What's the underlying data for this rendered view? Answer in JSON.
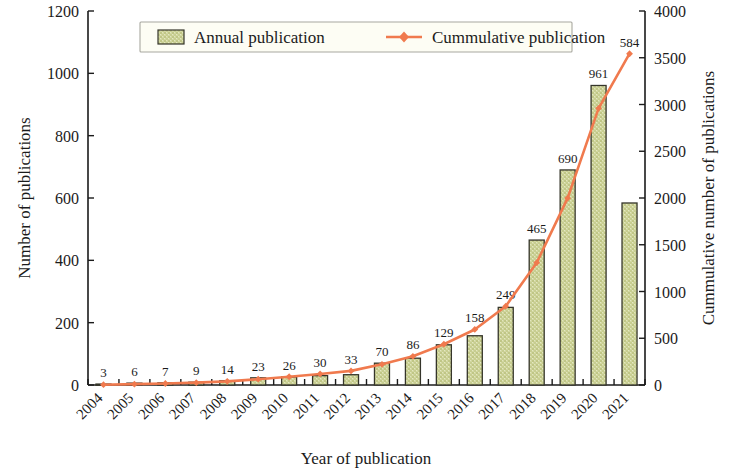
{
  "chart_data": {
    "type": "bar",
    "title": "",
    "subtitle": "",
    "xlabel": "Year of publication",
    "ylabel": "Number of publications",
    "y2label": "Cummulative number of publications",
    "categories": [
      "2004",
      "2005",
      "2006",
      "2007",
      "2008",
      "2009",
      "2010",
      "2011",
      "2012",
      "2013",
      "2014",
      "2015",
      "2016",
      "2017",
      "2018",
      "2019",
      "2020",
      "2021"
    ],
    "ylim": [
      0,
      1200
    ],
    "yticks": [
      0,
      200,
      400,
      600,
      800,
      1000,
      1200
    ],
    "y2lim": [
      0,
      4000
    ],
    "y2ticks": [
      0,
      500,
      1000,
      1500,
      2000,
      2500,
      3000,
      3500,
      4000
    ],
    "grid": false,
    "legend_position": "top-center",
    "series": [
      {
        "name": "Annual publication",
        "axis": "left",
        "kind": "bar",
        "color": "#ccd194",
        "edge_color": "#35352a",
        "values": [
          3,
          6,
          7,
          9,
          14,
          23,
          26,
          30,
          33,
          70,
          86,
          129,
          158,
          249,
          465,
          690,
          961,
          584
        ],
        "data_labels": [
          "3",
          "6",
          "7",
          "9",
          "14",
          "23",
          "26",
          "30",
          "33",
          "70",
          "86",
          "129",
          "158",
          "249",
          "465",
          "690",
          "961",
          "584"
        ]
      },
      {
        "name": "Cummulative publication",
        "axis": "right",
        "kind": "line",
        "color": "#f07a4e",
        "marker": "diamond",
        "values": [
          3,
          9,
          16,
          25,
          39,
          62,
          88,
          118,
          151,
          221,
          307,
          436,
          594,
          843,
          1308,
          1998,
          2959,
          3543
        ]
      }
    ]
  },
  "legend": {
    "items": [
      {
        "label": "Annual publication",
        "symbol": "swatch",
        "color": "#ccd194"
      },
      {
        "label": "Cummulative publication",
        "symbol": "line-marker",
        "color": "#f07a4e"
      }
    ]
  },
  "colors": {
    "bar_fill": "#ccd194",
    "bar_edge": "#35352a",
    "line": "#f07a4e",
    "axis": "#1b1b1b",
    "background": "#ffffff",
    "legend_bg": "#fdfdf4",
    "legend_border": "#a8a8a0"
  }
}
